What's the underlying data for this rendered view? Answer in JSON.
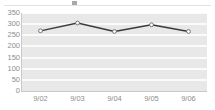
{
  "legend": {
    "ghost_label": "",
    "marker_name": "legend-marker"
  },
  "chart_data": {
    "type": "line",
    "title": "",
    "subtitle": "",
    "xlabel": "",
    "ylabel": "",
    "categories": [
      "9/02",
      "9/03",
      "9/04",
      "9/05",
      "9/06"
    ],
    "values": [
      270,
      305,
      267,
      297,
      267
    ],
    "series": [
      {
        "name": "",
        "values": [
          270,
          305,
          267,
          297,
          267
        ]
      }
    ],
    "ylim": [
      0,
      350
    ],
    "ytick_step": 50,
    "yticks": [
      0,
      50,
      100,
      150,
      200,
      250,
      300,
      350
    ],
    "ytick_labels": [
      "0",
      "50",
      "100",
      "150",
      "200",
      "250",
      "300",
      "350"
    ],
    "xtick_labels": [
      "9/02",
      "9/03",
      "9/04",
      "9/05",
      "9/06"
    ],
    "grid": true,
    "grid_orientation": "horizontal",
    "legend_position": "top",
    "legend_visible": true,
    "marker": "circle",
    "annotations": []
  },
  "style": {
    "plot_background": "#e8e8e8",
    "gridline_color": "#fbfbfb",
    "line_color": "#3b3b3b",
    "marker_fill": "#ffffff",
    "marker_stroke": "#6a6a6a",
    "tick_label_color": "#8d8d8d",
    "axis_color": "#c9c9c9",
    "page_background": "#ffffff"
  }
}
